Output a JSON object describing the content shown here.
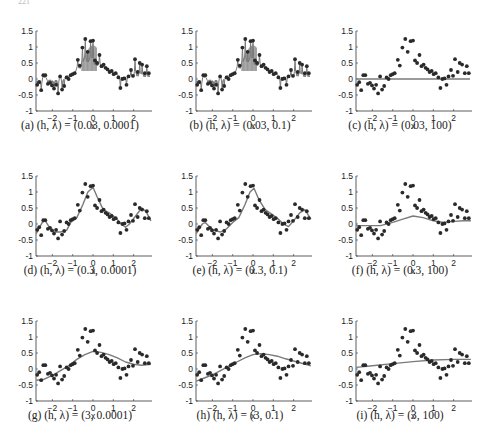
{
  "figure": {
    "header_fragment": "221"
  },
  "chart_data": {
    "type": "scatter",
    "layout": "3x3 grid of subplots",
    "xlabel": "x",
    "xticks": [
      -2,
      -1,
      0,
      1,
      2
    ],
    "yticks": [
      -1,
      -0.5,
      0,
      0.5,
      1,
      1.5
    ],
    "ytick_labels": [
      "-1",
      "-0.5",
      "0",
      "0.5",
      "1",
      "1.5"
    ],
    "xlim": [
      -2.8,
      2.9
    ],
    "ylim": [
      -1,
      1.5
    ],
    "grid": false,
    "points": {
      "x": [
        -2.75,
        -2.65,
        -2.55,
        -2.45,
        -2.35,
        -2.22,
        -2.12,
        -2.02,
        -1.92,
        -1.82,
        -1.72,
        -1.62,
        -1.52,
        -1.42,
        -1.3,
        -1.2,
        -1.1,
        -1.0,
        -0.9,
        -0.75,
        -0.65,
        -0.52,
        -0.38,
        -0.26,
        -0.12,
        0.0,
        0.1,
        0.2,
        0.32,
        0.42,
        0.52,
        0.62,
        0.72,
        0.82,
        0.92,
        1.02,
        1.12,
        1.25,
        1.35,
        1.45,
        1.55,
        1.65,
        1.75,
        1.87,
        1.97,
        2.07,
        2.2,
        2.3,
        2.42,
        2.55,
        2.65,
        2.75
      ],
      "y": [
        -0.18,
        -0.1,
        -0.35,
        0.12,
        0.12,
        -0.15,
        -0.12,
        -0.2,
        -0.3,
        -0.18,
        -0.45,
        0.08,
        -0.33,
        -0.22,
        0.05,
        0.0,
        0.12,
        0.15,
        0.18,
        0.6,
        0.42,
        0.98,
        1.25,
        0.85,
        1.18,
        1.2,
        0.58,
        0.5,
        0.75,
        0.4,
        0.45,
        0.35,
        0.3,
        0.22,
        0.25,
        0.15,
        0.18,
        0.05,
        -0.28,
        0.0,
        0.02,
        -0.18,
        0.08,
        0.28,
        0.1,
        0.62,
        0.22,
        0.5,
        0.45,
        0.18,
        0.4,
        0.18
      ]
    },
    "subplots": [
      {
        "id": "a",
        "caption": "(a) (h, λ) = (0.03, 0.0001)",
        "h": 0.03,
        "lambda": 0.0001,
        "fit": "interpolating spikes through each point"
      },
      {
        "id": "b",
        "caption": "(b) (h, λ) = (0.03, 0.1)",
        "h": 0.03,
        "lambda": 0.1,
        "fit": "interpolating spikes through each point"
      },
      {
        "id": "c",
        "caption": "(c) (h, λ) = (0.03, 100)",
        "h": 0.03,
        "lambda": 100,
        "fit": "flat line near 0"
      },
      {
        "id": "d",
        "caption": "(d) (h, λ) = (0.3, 0.0001)",
        "h": 0.3,
        "lambda": 0.0001,
        "fit": "wiggly smooth curve"
      },
      {
        "id": "e",
        "caption": "(e) (h, λ) = (0.3, 0.1)",
        "h": 0.3,
        "lambda": 0.1,
        "fit": "smooth curve"
      },
      {
        "id": "f",
        "caption": "(f) (h, λ) = (0.3, 100)",
        "h": 0.3,
        "lambda": 100,
        "fit": "low bump peaking ~0.25 at x=0"
      },
      {
        "id": "g",
        "caption": "(g) (h, λ) = (3, 0.0001)",
        "h": 3,
        "lambda": 0.0001,
        "fit": "broad curve peaking ~0.55"
      },
      {
        "id": "h",
        "caption": "(h) (h, λ) = (3, 0.1)",
        "h": 3,
        "lambda": 0.1,
        "fit": "broad arch peaking ~0.48"
      },
      {
        "id": "i",
        "caption": "(i) (h, λ) = (3, 100)",
        "h": 3,
        "lambda": 100,
        "fit": "nearly linear rising from 0.05 to 0.3"
      }
    ],
    "fit_curves": {
      "d": {
        "x": [
          -2.8,
          -2.5,
          -2.35,
          -2.1,
          -1.9,
          -1.6,
          -1.3,
          -1.1,
          -0.8,
          -0.5,
          -0.25,
          0.0,
          0.2,
          0.5,
          0.8,
          1.1,
          1.4,
          1.6,
          1.8,
          2.1,
          2.4,
          2.6,
          2.85
        ],
        "y": [
          -0.3,
          0.05,
          0.1,
          -0.15,
          -0.25,
          -0.25,
          -0.2,
          0.05,
          0.2,
          0.6,
          1.0,
          1.15,
          0.85,
          0.45,
          0.35,
          0.2,
          0.0,
          -0.1,
          0.0,
          0.25,
          0.5,
          0.4,
          0.1
        ]
      },
      "e": {
        "x": [
          -2.8,
          -2.5,
          -2.35,
          -2.1,
          -1.9,
          -1.6,
          -1.3,
          -1.0,
          -0.7,
          -0.4,
          -0.15,
          0.05,
          0.3,
          0.6,
          0.9,
          1.2,
          1.5,
          1.75,
          2.0,
          2.3,
          2.55,
          2.85
        ],
        "y": [
          -0.3,
          0.0,
          0.05,
          -0.12,
          -0.2,
          -0.25,
          -0.15,
          0.05,
          0.2,
          0.6,
          1.0,
          1.12,
          0.75,
          0.45,
          0.32,
          0.18,
          0.0,
          -0.08,
          0.1,
          0.35,
          0.45,
          0.15
        ]
      },
      "f": {
        "x": [
          -2.8,
          -2.2,
          -1.6,
          -1.0,
          -0.5,
          0.0,
          0.5,
          1.0,
          1.5,
          2.0,
          2.5,
          2.85
        ],
        "y": [
          -0.05,
          -0.05,
          -0.05,
          0.05,
          0.15,
          0.25,
          0.2,
          0.1,
          0.05,
          0.08,
          0.1,
          0.1
        ]
      },
      "g": {
        "x": [
          -2.8,
          -2.4,
          -2.0,
          -1.6,
          -1.2,
          -0.8,
          -0.4,
          0.0,
          0.4,
          0.8,
          1.2,
          1.6,
          2.0,
          2.4,
          2.85
        ],
        "y": [
          -0.35,
          -0.32,
          -0.2,
          -0.05,
          0.1,
          0.3,
          0.45,
          0.55,
          0.52,
          0.45,
          0.35,
          0.22,
          0.15,
          0.12,
          0.15
        ]
      },
      "h": {
        "x": [
          -2.8,
          -2.4,
          -2.0,
          -1.6,
          -1.2,
          -0.8,
          -0.4,
          0.0,
          0.4,
          0.8,
          1.2,
          1.6,
          2.0,
          2.4,
          2.85
        ],
        "y": [
          -0.38,
          -0.28,
          -0.18,
          -0.05,
          0.08,
          0.22,
          0.35,
          0.45,
          0.48,
          0.45,
          0.4,
          0.32,
          0.25,
          0.18,
          0.1
        ]
      },
      "i": {
        "x": [
          -2.8,
          -2.0,
          -1.0,
          0.0,
          1.0,
          2.0,
          2.85
        ],
        "y": [
          0.05,
          0.1,
          0.17,
          0.23,
          0.28,
          0.3,
          0.3
        ]
      }
    }
  },
  "colors": {
    "points": "#2a2a2a",
    "curve": "#7a7a7a",
    "axis": "#333333",
    "text": "#222222"
  }
}
